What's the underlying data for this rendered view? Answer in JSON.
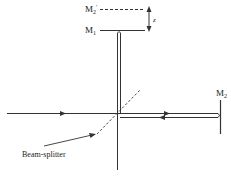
{
  "diagram": {
    "labels": {
      "mirror_image": "M",
      "mirror_image_sub": "2",
      "mirror_image_prime": "'",
      "mirror1": "M",
      "mirror1_sub": "1",
      "mirror2": "M",
      "mirror2_sub": "2",
      "displacement": "z",
      "beam_splitter": "Beam-splitter"
    },
    "colors": {
      "line": "#333333",
      "background": "#ffffff"
    }
  }
}
